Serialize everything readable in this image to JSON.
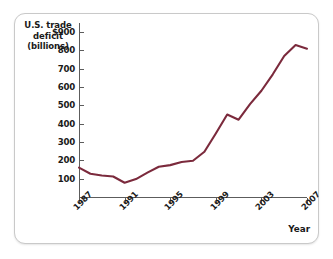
{
  "figure": {
    "y_axis_title_lines": [
      "U.S. trade",
      "deficit",
      "(billions)"
    ],
    "x_axis_title": "Year",
    "line_color": "#7b2a3c"
  },
  "chart_data": {
    "type": "line",
    "title": "",
    "xlabel": "Year",
    "ylabel": "U.S. trade deficit (billions)",
    "xlim": [
      1987,
      2007
    ],
    "ylim": [
      0,
      950
    ],
    "grid": false,
    "legend": null,
    "y_ticks": [
      "$900",
      "800",
      "700",
      "600",
      "500",
      "400",
      "300",
      "200",
      "100"
    ],
    "y_tick_values": [
      900,
      800,
      700,
      600,
      500,
      400,
      300,
      200,
      100
    ],
    "x_ticks": [
      "1987",
      "1991",
      "1995",
      "1999",
      "2003",
      "2007"
    ],
    "x_tick_values": [
      1987,
      1991,
      1995,
      1999,
      2003,
      2007
    ],
    "series": [
      {
        "name": "U.S. trade deficit",
        "color": "#7b2a3c",
        "x": [
          1987,
          1988,
          1989,
          1990,
          1991,
          1992,
          1993,
          1994,
          1995,
          1996,
          1997,
          1998,
          1999,
          2000,
          2001,
          2002,
          2003,
          2004,
          2005,
          2006,
          2007
        ],
        "values": [
          160,
          127,
          117,
          112,
          78,
          98,
          133,
          165,
          174,
          191,
          198,
          247,
          347,
          450,
          422,
          507,
          580,
          670,
          770,
          830,
          810
        ]
      }
    ]
  }
}
